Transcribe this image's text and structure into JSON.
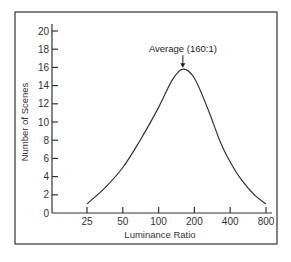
{
  "chart_data": {
    "type": "line",
    "title": "",
    "xlabel": "Luminance Ratio",
    "ylabel": "Number of Scenes",
    "x_scale": "log2",
    "x_ticks": [
      25,
      50,
      100,
      200,
      400,
      800
    ],
    "x_tick_labels": [
      "25",
      "50",
      "100",
      "200",
      "400",
      "800"
    ],
    "y_ticks": [
      0,
      2,
      4,
      6,
      8,
      10,
      12,
      14,
      16,
      18,
      20
    ],
    "y_tick_labels": [
      "0",
      "2",
      "4",
      "6",
      "8",
      "10",
      "12",
      "14",
      "16",
      "18",
      "20"
    ],
    "ylim": [
      0,
      20
    ],
    "xlim": [
      14,
      900
    ],
    "grid": false,
    "legend": null,
    "series": [
      {
        "name": "Distribution of scenes",
        "x": [
          25,
          35,
          50,
          70,
          100,
          130,
          160,
          200,
          260,
          330,
          400,
          500,
          650,
          800
        ],
        "y": [
          1,
          2.7,
          5.0,
          8.0,
          11.6,
          14.6,
          15.8,
          14.8,
          11.4,
          7.8,
          5.6,
          3.6,
          1.9,
          1.0
        ]
      }
    ],
    "annotations": [
      {
        "text": "Average (160:1)",
        "x": 160,
        "y": 15.8,
        "arrow": true
      }
    ]
  }
}
